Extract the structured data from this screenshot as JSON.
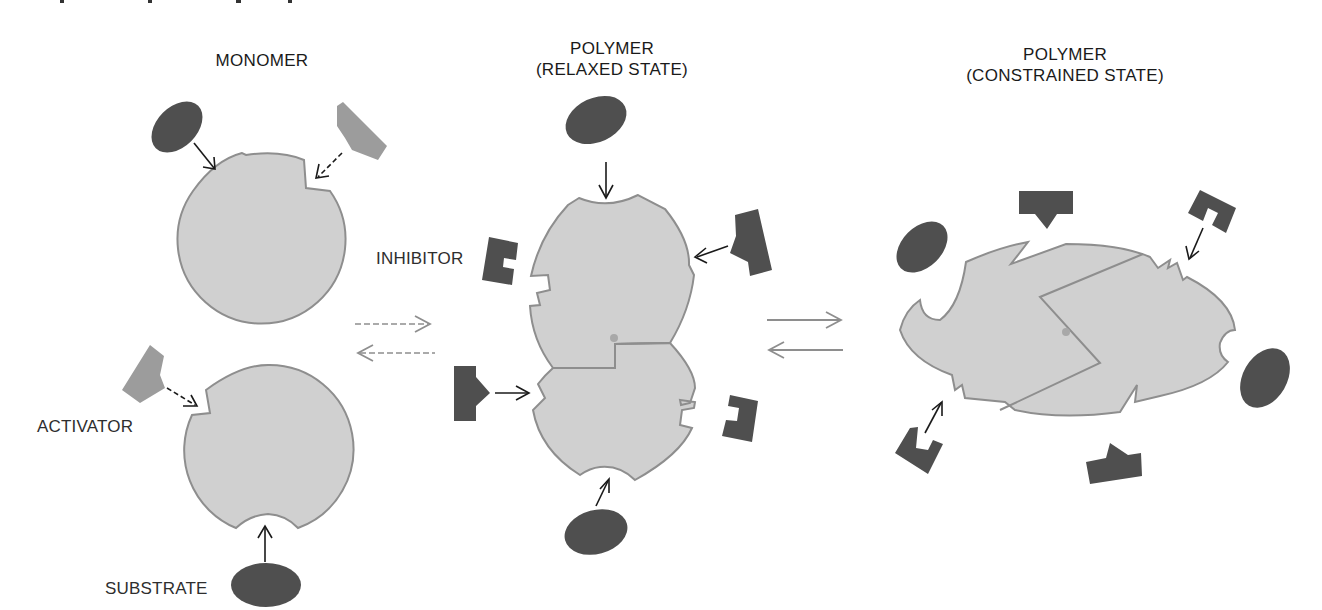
{
  "diagram": {
    "type": "allosteric-enzyme-schematic",
    "columns": [
      {
        "id": "monomer",
        "title_line1": "MONOMER",
        "title_line2": ""
      },
      {
        "id": "polymer-relaxed",
        "title_line1": "POLYMER",
        "title_line2": "(RELAXED STATE)"
      },
      {
        "id": "polymer-constrained",
        "title_line1": "POLYMER",
        "title_line2": "(CONSTRAINED STATE)"
      }
    ],
    "labels": {
      "inhibitor": "INHIBITOR",
      "activator": "ACTIVATOR",
      "substrate": "SUBSTRATE"
    },
    "equilibria": [
      {
        "between": [
          "monomer",
          "polymer-relaxed"
        ],
        "style": "dashed",
        "direction": "reversible"
      },
      {
        "between": [
          "polymer-relaxed",
          "polymer-constrained"
        ],
        "style": "solid",
        "direction": "reversible"
      }
    ],
    "colors": {
      "enzyme_body": "#d0d0d0",
      "enzyme_outline": "#8e8e8e",
      "substrate_inhibitor": "#4f4f4f",
      "activator": "#9c9c9c",
      "arrows": "#1a1a1a",
      "equilibrium_arrows": "#8e8e8e"
    },
    "legend_shapes": {
      "substrate": "dark-oval",
      "inhibitor": "dark-notched-block",
      "activator": "light-wedge"
    }
  }
}
